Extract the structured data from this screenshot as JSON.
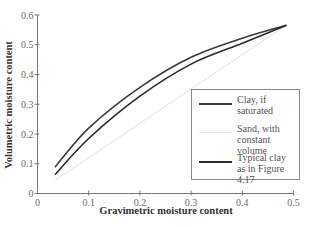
{
  "chart_data": {
    "type": "line",
    "title": "",
    "xlabel": "Gravimetric moisture content",
    "ylabel": "Volumetric moisture content",
    "xlim": [
      0,
      0.5
    ],
    "ylim": [
      0,
      0.6
    ],
    "xticks": [
      "0",
      "0.1",
      "0.2",
      "0.3",
      "0.4",
      "0.5"
    ],
    "yticks": [
      "0",
      "0.1",
      "0.2",
      "0.3",
      "0.4",
      "0.5",
      "0.6"
    ],
    "grid": false,
    "legend_position": "lower right",
    "series": [
      {
        "name": "Clay, if saturated",
        "color": "#3a3a3a",
        "x": [
          0.035,
          0.1,
          0.2,
          0.3,
          0.4,
          0.485
        ],
        "y": [
          0.09,
          0.22,
          0.357,
          0.458,
          0.522,
          0.565
        ]
      },
      {
        "name": "Sand, with constant volume",
        "color": "#e0e0e0",
        "x": [
          0.035,
          0.485
        ],
        "y": [
          0.045,
          0.565
        ]
      },
      {
        "name": "Typical clay as in Figure 4.17",
        "color": "#2a2a2a",
        "x": [
          0.035,
          0.1,
          0.2,
          0.3,
          0.4,
          0.485
        ],
        "y": [
          0.065,
          0.185,
          0.327,
          0.435,
          0.505,
          0.565
        ]
      }
    ]
  },
  "legend": {
    "items": [
      {
        "label_line1": "Clay, if",
        "label_line2": "saturated",
        "color": "#3a3a3a"
      },
      {
        "label_line1": "Sand, with",
        "label_line2": "constant volume",
        "color": "#e3e3e3"
      },
      {
        "label_line1": "Typical clay",
        "label_line2": "as in Figure 4.17",
        "color": "#2a2a2a"
      }
    ]
  }
}
